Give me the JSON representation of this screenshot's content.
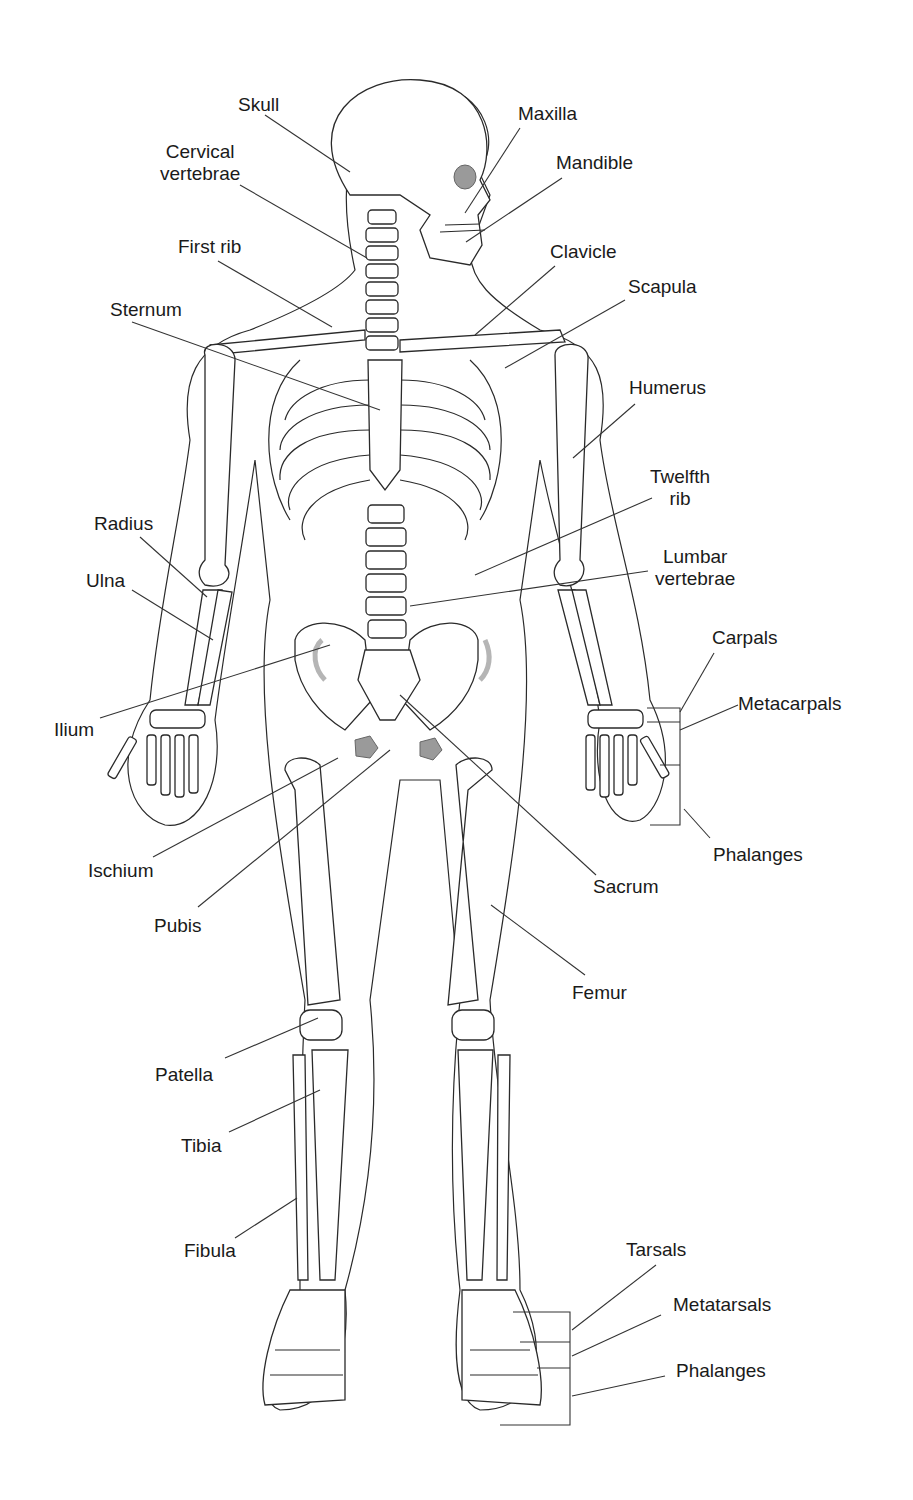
{
  "diagram": {
    "labels": [
      {
        "id": "skull",
        "text": "Skull",
        "x": 238,
        "y": 94
      },
      {
        "id": "maxilla",
        "text": "Maxilla",
        "x": 518,
        "y": 103
      },
      {
        "id": "cervical",
        "text": "Cervical\nvertebrae",
        "x": 160,
        "y": 141
      },
      {
        "id": "mandible",
        "text": "Mandible",
        "x": 556,
        "y": 152
      },
      {
        "id": "first_rib",
        "text": "First rib",
        "x": 178,
        "y": 236
      },
      {
        "id": "clavicle",
        "text": "Clavicle",
        "x": 550,
        "y": 241
      },
      {
        "id": "scapula",
        "text": "Scapula",
        "x": 628,
        "y": 276
      },
      {
        "id": "sternum",
        "text": "Sternum",
        "x": 110,
        "y": 299
      },
      {
        "id": "humerus",
        "text": "Humerus",
        "x": 629,
        "y": 377
      },
      {
        "id": "twelfth_rib",
        "text": "Twelfth\nrib",
        "x": 650,
        "y": 466
      },
      {
        "id": "radius",
        "text": "Radius",
        "x": 94,
        "y": 513
      },
      {
        "id": "lumbar",
        "text": "Lumbar\nvertebrae",
        "x": 655,
        "y": 546
      },
      {
        "id": "ulna",
        "text": "Ulna",
        "x": 86,
        "y": 570
      },
      {
        "id": "carpals",
        "text": "Carpals",
        "x": 712,
        "y": 627
      },
      {
        "id": "metacarpals",
        "text": "Metacarpals",
        "x": 738,
        "y": 693
      },
      {
        "id": "ilium",
        "text": "Ilium",
        "x": 54,
        "y": 719
      },
      {
        "id": "phalanges_hand",
        "text": "Phalanges",
        "x": 713,
        "y": 844
      },
      {
        "id": "ischium",
        "text": "Ischium",
        "x": 88,
        "y": 860
      },
      {
        "id": "sacrum",
        "text": "Sacrum",
        "x": 593,
        "y": 876
      },
      {
        "id": "pubis",
        "text": "Pubis",
        "x": 154,
        "y": 915
      },
      {
        "id": "femur",
        "text": "Femur",
        "x": 572,
        "y": 982
      },
      {
        "id": "patella",
        "text": "Patella",
        "x": 155,
        "y": 1064
      },
      {
        "id": "tibia",
        "text": "Tibia",
        "x": 181,
        "y": 1135
      },
      {
        "id": "fibula",
        "text": "Fibula",
        "x": 184,
        "y": 1240
      },
      {
        "id": "tarsals",
        "text": "Tarsals",
        "x": 626,
        "y": 1239
      },
      {
        "id": "metatarsals",
        "text": "Metatarsals",
        "x": 673,
        "y": 1294
      },
      {
        "id": "phalanges_foot",
        "text": "Phalanges",
        "x": 676,
        "y": 1360
      }
    ]
  }
}
